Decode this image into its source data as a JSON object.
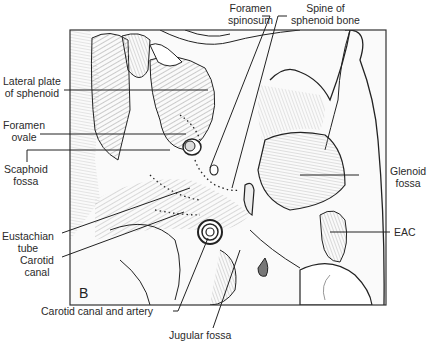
{
  "figure": {
    "panel_letter": "B",
    "labels": {
      "foramen_spinosum": [
        "Foramen",
        "spinosum"
      ],
      "spine_of_sphenoid": [
        "Spine of",
        "sphenoid bone"
      ],
      "lateral_plate": [
        "Lateral plate",
        "of sphenoid"
      ],
      "foramen_ovale": [
        "Foramen",
        "ovale"
      ],
      "scaphoid_fossa": [
        "Scaphoid",
        "fossa"
      ],
      "glenoid_fossa": [
        "Glenoid",
        "fossa"
      ],
      "eac": [
        "EAC"
      ],
      "eustachian_tube": [
        "Eustachian",
        "tube"
      ],
      "carotid_canal": [
        "Carotid",
        "canal"
      ],
      "carotid_canal_artery": [
        "Carotid canal and artery"
      ],
      "jugular_fossa": [
        "Jugular fossa"
      ]
    }
  },
  "colors": {
    "ink": "#1e1e1e",
    "shade": "#8a8a8a",
    "light_shade": "#c8c8c8",
    "background": "#ffffff"
  }
}
